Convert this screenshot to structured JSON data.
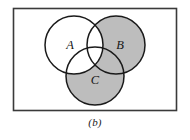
{
  "figure": {
    "caption": "(b)",
    "kind": "venn-diagram",
    "set_count": 3
  },
  "frame": {
    "border_color": "#3a3a3a",
    "fill_color": "#ffffff",
    "x": 13,
    "y": 8,
    "width": 163,
    "height": 102
  },
  "palette": {
    "shaded": "#bdbdbd",
    "unshaded": "#ffffff",
    "outline": "#1a1a1a",
    "caption_color": "#1a1a1a"
  },
  "sets": [
    {
      "label": "A",
      "cx": 74,
      "cy": 45,
      "r": 29,
      "fill": "#ffffff",
      "label_x": 70,
      "label_y": 45
    },
    {
      "label": "B",
      "cx": 116,
      "cy": 45,
      "r": 29,
      "fill": "#bdbdbd",
      "label_x": 120,
      "label_y": 45
    },
    {
      "label": "C",
      "cx": 95,
      "cy": 76,
      "r": 29,
      "fill": "#bdbdbd",
      "label_x": 95,
      "label_y": 80
    }
  ],
  "shading": {
    "description": "Region (B union C) excluding A is shaded gray; all regions inside A are unshaded white.",
    "shaded_regions": [
      "B only",
      "C only",
      "B and C not A"
    ],
    "unshaded_regions": [
      "A only",
      "A and B",
      "A and C",
      "A and B and C"
    ]
  }
}
